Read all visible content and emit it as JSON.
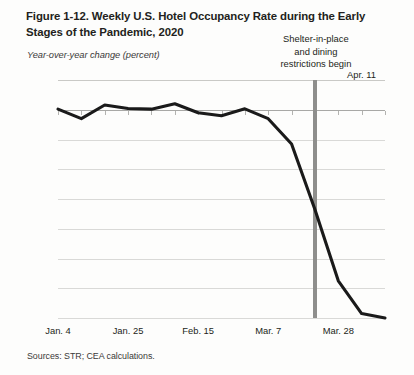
{
  "figure": {
    "title": "Figure 1-12. Weekly U.S. Hotel Occupancy Rate during the Early Stages of the Pandemic, 2020",
    "y_unit_label": "Year-over-year change (percent)",
    "source_note": "Sources: STR; CEA calculations."
  },
  "chart_data": {
    "type": "line",
    "title": "Figure 1-12. Weekly U.S. Hotel Occupancy Rate during the Early Stages of the Pandemic, 2020",
    "xlabel": "",
    "ylabel": "Year-over-year change (percent)",
    "ylim": [
      -70,
      10
    ],
    "yticks": [
      10,
      0,
      -10,
      -20,
      -30,
      -40,
      -50,
      -60,
      -70
    ],
    "ytick_labels": [
      "10",
      "0",
      "-10",
      "-20",
      "-30",
      "-40",
      "-50",
      "-60",
      "-70"
    ],
    "xtick_labels": [
      "Jan. 4",
      "Jan. 25",
      "Feb. 15",
      "Mar. 7",
      "Mar. 28"
    ],
    "xtick_indices": [
      0,
      3,
      6,
      9,
      12
    ],
    "grid": true,
    "legend": null,
    "x": [
      "Jan. 4",
      "Jan. 11",
      "Jan. 18",
      "Jan. 25",
      "Feb. 1",
      "Feb. 8",
      "Feb. 15",
      "Feb. 22",
      "Feb. 29",
      "Mar. 7",
      "Mar. 14",
      "Mar. 21",
      "Mar. 28",
      "Apr. 4",
      "Apr. 11"
    ],
    "values": [
      0.2,
      -3.0,
      1.6,
      0.4,
      0.2,
      2.0,
      -1.0,
      -2.0,
      0.3,
      -3.0,
      -11.5,
      -33.5,
      -57.5,
      -68.5,
      -70.0
    ],
    "series": [
      {
        "name": "Weekly U.S. hotel occupancy rate, year-over-year change",
        "color": "#1a1a1a",
        "values": [
          0.2,
          -3.0,
          1.6,
          0.4,
          0.2,
          2.0,
          -1.0,
          -2.0,
          0.3,
          -3.0,
          -11.5,
          -33.5,
          -57.5,
          -68.5,
          -70.0
        ]
      }
    ],
    "annotations": [
      {
        "name": "shelter-in-place-marker",
        "text": "Shelter-in-place and dining restrictions begin",
        "text_lines": [
          "Shelter-in-place",
          "and dining",
          "restrictions begin"
        ],
        "x": "Mar. 21",
        "x_index": 11,
        "marker_color": "#8e8e8c"
      },
      {
        "name": "endpoint-label",
        "text": "Apr. 11",
        "x": "Apr. 11",
        "x_index": 14
      }
    ]
  }
}
